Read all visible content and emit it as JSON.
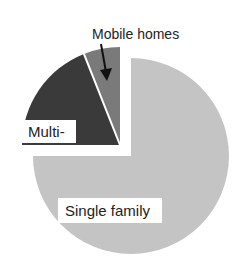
{
  "chart_data": {
    "type": "pie",
    "title": "",
    "slices": [
      {
        "label": "Single family",
        "value": 75,
        "color": "#c4c4c4",
        "exploded": false
      },
      {
        "label": "Multi-family",
        "display_label": "Multi-",
        "value": 19,
        "color": "#3a3a3a",
        "exploded": true
      },
      {
        "label": "Mobile homes",
        "value": 6,
        "color": "#7a7a7a",
        "exploded": true
      }
    ],
    "start_angle_deg": 0,
    "direction": "clockwise",
    "legend": "none",
    "annotations": [
      {
        "text": "Mobile homes",
        "type": "arrow-callout",
        "target": "Mobile homes"
      }
    ]
  },
  "labels": {
    "single": "Single family",
    "multi": "Multi-",
    "mobile": "Mobile homes"
  },
  "geometry": {
    "main_center": [
      131,
      156
    ],
    "exploded_center": [
      120,
      145
    ],
    "radius": 98
  }
}
